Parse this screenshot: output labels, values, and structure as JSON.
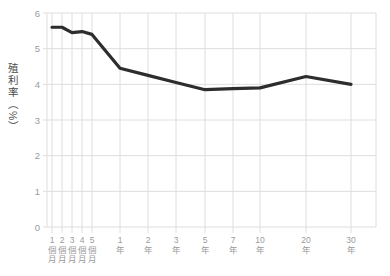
{
  "chart_data": {
    "type": "line",
    "title": "",
    "xlabel": "",
    "ylabel": "殖利率（%）",
    "categories": [
      "1個月",
      "2個月",
      "3個月",
      "4個月",
      "5個月",
      "1年",
      "2年",
      "3年",
      "5年",
      "7年",
      "10年",
      "20年",
      "30年"
    ],
    "values": [
      5.6,
      5.6,
      5.45,
      5.48,
      5.4,
      4.45,
      4.25,
      4.05,
      3.85,
      3.88,
      3.9,
      4.22,
      4.0
    ],
    "ylim": [
      0,
      6
    ],
    "y_ticks": [
      0,
      1,
      2,
      3,
      4,
      5,
      6
    ],
    "grid": true,
    "legend": "none",
    "line_color": "#2d2d2d",
    "grid_color": "#dedede",
    "tick_color": "#9a9a9a",
    "axis_title_color": "#4a4a4a",
    "background_color": "#ffffff",
    "x_tick_px": [
      52,
      62,
      72,
      82,
      92,
      120,
      148,
      176,
      205,
      233,
      260,
      306,
      351
    ],
    "plot_px": {
      "left": 47,
      "right": 376,
      "top": 13,
      "bottom": 227
    }
  }
}
